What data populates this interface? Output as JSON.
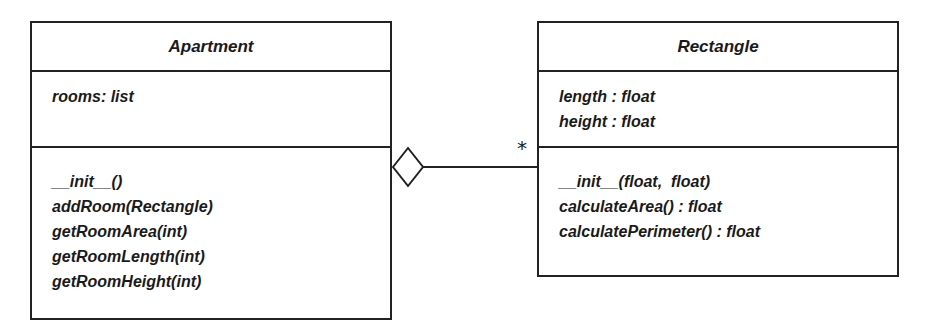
{
  "diagram": {
    "type": "uml-class-diagram",
    "classes": [
      {
        "name": "Apartment",
        "attributes": [
          "rooms: list"
        ],
        "operations": [
          "__init__()",
          "addRoom(Rectangle)",
          "getRoomArea(int)",
          "getRoomLength(int)",
          "getRoomHeight(int)"
        ]
      },
      {
        "name": "Rectangle",
        "attributes": [
          "length : float",
          "height : float"
        ],
        "operations": [
          "__init__(float,  float)",
          "calculateArea() : float",
          "calculatePerimeter() : float"
        ]
      }
    ],
    "relationship": {
      "type": "aggregation",
      "from": "Apartment",
      "to": "Rectangle",
      "multiplicity_to": "*"
    }
  }
}
